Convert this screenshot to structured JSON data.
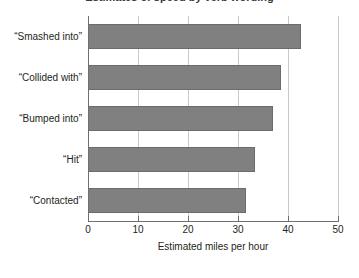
{
  "chart_data": {
    "type": "bar",
    "orientation": "horizontal",
    "title": "Estimates of speed by verb wording",
    "categories": [
      "“Smashed into”",
      "“Collided with”",
      "“Bumped into”",
      "“Hit”",
      "“Contacted”"
    ],
    "values": [
      42.5,
      38.5,
      37.0,
      33.3,
      31.5
    ],
    "xlabel": "Estimated miles per hour",
    "ylabel": "",
    "xlim": [
      0,
      50
    ],
    "xticks": [
      "0",
      "10",
      "20",
      "30",
      "40",
      "50"
    ],
    "xtick_values": [
      0,
      10,
      20,
      30,
      40,
      50
    ],
    "grid": "vertical",
    "legend": "none",
    "bar_color": "#808080",
    "bar_edge_color": "#6b6b6b",
    "gridline_color": "#c9c9c9",
    "axis_color": "#6f6f6f",
    "background": "#ffffff"
  }
}
